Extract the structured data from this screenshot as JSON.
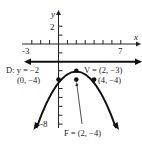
{
  "figure": {
    "type": "parabola-graph",
    "axes": {
      "x_label": "x",
      "y_label": "y",
      "x_tick_labels": [
        "-3",
        "7"
      ],
      "y_tick_labels": [
        "2",
        "-8"
      ],
      "x_range": [
        -3,
        7
      ],
      "y_range": [
        -8,
        2
      ]
    },
    "directrix": {
      "label": "D: y = −2",
      "equation": "y = -2"
    },
    "vertex": {
      "label": "V = (2, −3)",
      "x": 2,
      "y": -3
    },
    "focus": {
      "label": "F = (2, −4)",
      "x": 2,
      "y": -4
    },
    "points": [
      {
        "label": "(0, −4)",
        "x": 0,
        "y": -4
      },
      {
        "label": "(4, −4)",
        "x": 4,
        "y": -4
      }
    ]
  }
}
